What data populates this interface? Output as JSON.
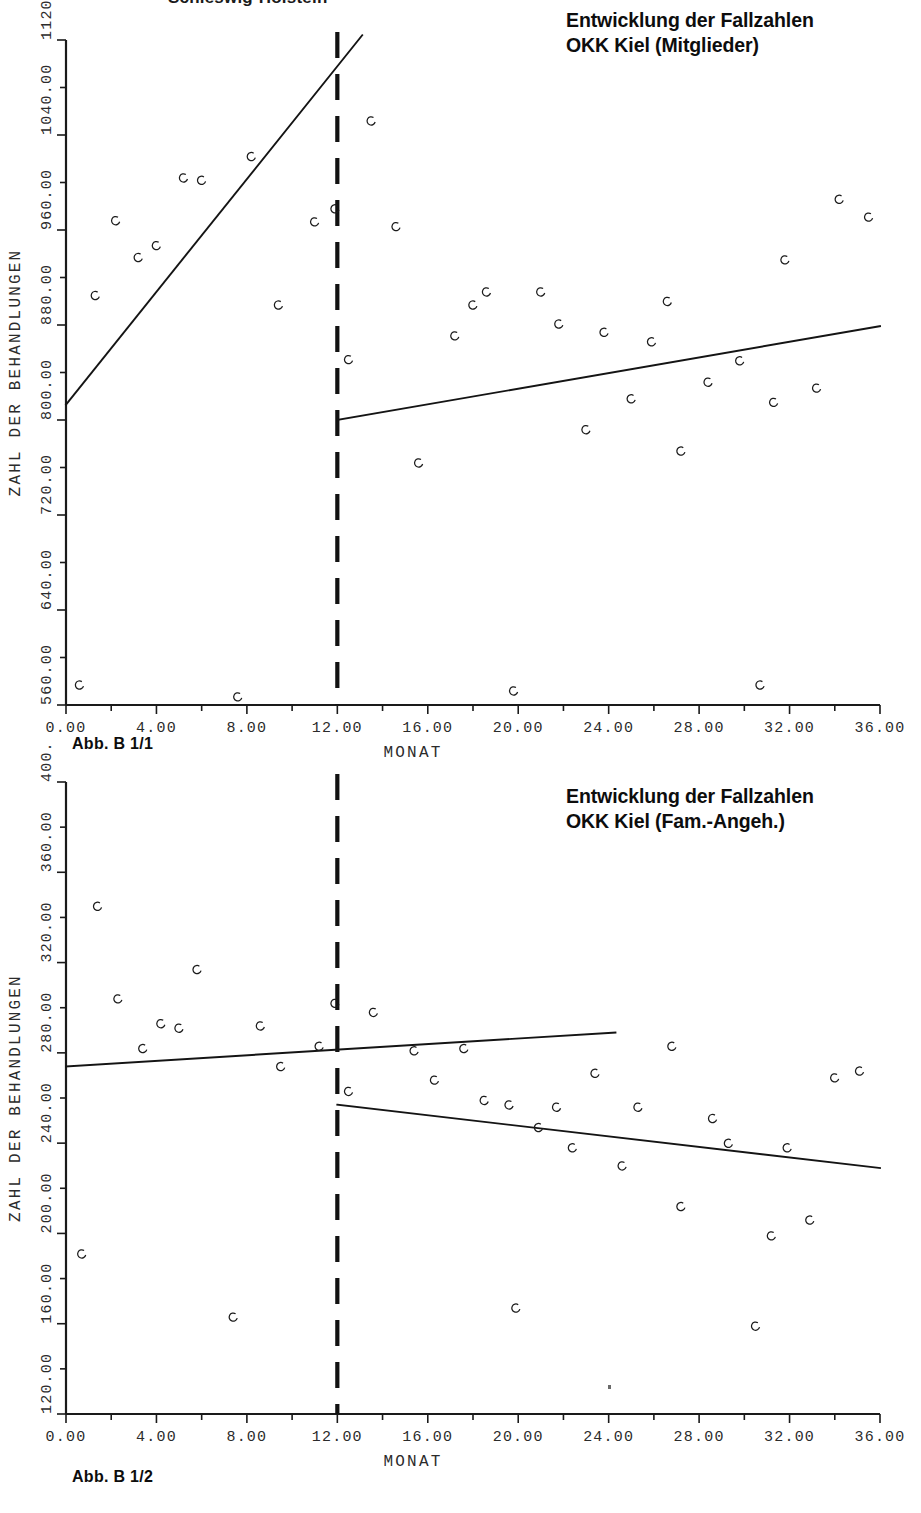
{
  "page": {
    "top_heading": "Schleswig-Holstein"
  },
  "figures": [
    {
      "id": "figure-1",
      "title_lines": [
        "Entwicklung der Fallzahlen",
        "OKK Kiel (Mitglieder)"
      ],
      "caption": "Abb. B 1/1",
      "chart_data": {
        "type": "scatter",
        "title": "Entwicklung der Fallzahlen OKK Kiel (Mitglieder)",
        "xlabel": "MONAT",
        "ylabel": "ZAHL DER BEHANDLUNGEN",
        "xlim": [
          0,
          36
        ],
        "ylim": [
          560,
          1120
        ],
        "xticks": [
          "0.00",
          "4.00",
          "8.00",
          "12.00",
          "16.00",
          "20.00",
          "24.00",
          "28.00",
          "32.00",
          "36.00"
        ],
        "xtick_values": [
          0,
          4,
          8,
          12,
          16,
          20,
          24,
          28,
          32,
          36
        ],
        "yticks": [
          "560.00",
          "640.00",
          "720.00",
          "800.00",
          "880.00",
          "960.00",
          "1040.00",
          "1120.00"
        ],
        "ytick_values": [
          560,
          640,
          720,
          800,
          880,
          960,
          1040,
          1120
        ],
        "grid": false,
        "legend": "none",
        "intervention_marker": {
          "label": "12.00",
          "x": 12,
          "style": "dashed-vertical"
        },
        "points": [
          {
            "x": 0.6,
            "y": 577
          },
          {
            "x": 1.3,
            "y": 905
          },
          {
            "x": 2.2,
            "y": 968
          },
          {
            "x": 3.2,
            "y": 937
          },
          {
            "x": 4.0,
            "y": 947
          },
          {
            "x": 5.2,
            "y": 1004
          },
          {
            "x": 6.0,
            "y": 1002
          },
          {
            "x": 7.6,
            "y": 567
          },
          {
            "x": 8.2,
            "y": 1022
          },
          {
            "x": 9.4,
            "y": 897
          },
          {
            "x": 11.0,
            "y": 967
          },
          {
            "x": 11.9,
            "y": 978
          },
          {
            "x": 12.5,
            "y": 851
          },
          {
            "x": 13.5,
            "y": 1052
          },
          {
            "x": 14.6,
            "y": 963
          },
          {
            "x": 15.6,
            "y": 764
          },
          {
            "x": 17.2,
            "y": 871
          },
          {
            "x": 18.0,
            "y": 897
          },
          {
            "x": 18.6,
            "y": 908
          },
          {
            "x": 19.8,
            "y": 572
          },
          {
            "x": 21.0,
            "y": 908
          },
          {
            "x": 21.8,
            "y": 881
          },
          {
            "x": 23.0,
            "y": 792
          },
          {
            "x": 23.8,
            "y": 874
          },
          {
            "x": 25.0,
            "y": 818
          },
          {
            "x": 25.9,
            "y": 866
          },
          {
            "x": 26.6,
            "y": 900
          },
          {
            "x": 27.2,
            "y": 774
          },
          {
            "x": 28.4,
            "y": 832
          },
          {
            "x": 29.8,
            "y": 850
          },
          {
            "x": 30.7,
            "y": 577
          },
          {
            "x": 31.3,
            "y": 815
          },
          {
            "x": 31.8,
            "y": 935
          },
          {
            "x": 33.2,
            "y": 827
          },
          {
            "x": 34.2,
            "y": 986
          },
          {
            "x": 35.5,
            "y": 971
          }
        ],
        "trend_lines": [
          {
            "name": "pre-intervention",
            "x0": 0,
            "y0": 813,
            "x1": 13.1,
            "y1": 1124
          },
          {
            "name": "post-intervention",
            "x0": 12.0,
            "y0": 800,
            "x1": 36.0,
            "y1": 879
          }
        ]
      }
    },
    {
      "id": "figure-2",
      "title_lines": [
        "Entwicklung der Fallzahlen",
        "OKK Kiel (Fam.-Angeh.)"
      ],
      "caption": "Abb. B 1/2",
      "chart_data": {
        "type": "scatter",
        "title": "Entwicklung der Fallzahlen OKK Kiel (Fam.-Angeh.)",
        "xlabel": "MONAT",
        "ylabel": "ZAHL DER BEHANDLUNGEN",
        "xlim": [
          0,
          36
        ],
        "ylim": [
          120,
          400
        ],
        "xticks": [
          "0.00",
          "4.00",
          "8.00",
          "12.00",
          "16.00",
          "20.00",
          "24.00",
          "28.00",
          "32.00",
          "36.00"
        ],
        "xtick_values": [
          0,
          4,
          8,
          12,
          16,
          20,
          24,
          28,
          32,
          36
        ],
        "yticks": [
          "120.00",
          "160.00",
          "200.00",
          "240.00",
          "280.00",
          "320.00",
          "360.00",
          "400.00"
        ],
        "ytick_values": [
          120,
          160,
          200,
          240,
          280,
          320,
          360,
          400
        ],
        "grid": false,
        "legend": "none",
        "intervention_marker": {
          "label": "12.00",
          "x": 12,
          "style": "dashed-vertical"
        },
        "points": [
          {
            "x": 0.7,
            "y": 191
          },
          {
            "x": 1.4,
            "y": 345
          },
          {
            "x": 2.3,
            "y": 304
          },
          {
            "x": 3.4,
            "y": 282
          },
          {
            "x": 4.2,
            "y": 293
          },
          {
            "x": 5.0,
            "y": 291
          },
          {
            "x": 5.8,
            "y": 317
          },
          {
            "x": 7.4,
            "y": 163
          },
          {
            "x": 8.6,
            "y": 292
          },
          {
            "x": 9.5,
            "y": 274
          },
          {
            "x": 11.2,
            "y": 283
          },
          {
            "x": 11.9,
            "y": 302
          },
          {
            "x": 12.5,
            "y": 263
          },
          {
            "x": 13.6,
            "y": 298
          },
          {
            "x": 15.4,
            "y": 281
          },
          {
            "x": 16.3,
            "y": 268
          },
          {
            "x": 17.6,
            "y": 282
          },
          {
            "x": 18.5,
            "y": 259
          },
          {
            "x": 19.6,
            "y": 257
          },
          {
            "x": 19.9,
            "y": 167
          },
          {
            "x": 20.9,
            "y": 247
          },
          {
            "x": 21.7,
            "y": 256
          },
          {
            "x": 22.4,
            "y": 238
          },
          {
            "x": 23.4,
            "y": 271
          },
          {
            "x": 24.6,
            "y": 230
          },
          {
            "x": 25.3,
            "y": 256
          },
          {
            "x": 26.8,
            "y": 283
          },
          {
            "x": 27.2,
            "y": 212
          },
          {
            "x": 28.6,
            "y": 251
          },
          {
            "x": 29.3,
            "y": 240
          },
          {
            "x": 30.5,
            "y": 159
          },
          {
            "x": 31.2,
            "y": 199
          },
          {
            "x": 31.9,
            "y": 238
          },
          {
            "x": 32.9,
            "y": 206
          },
          {
            "x": 34.0,
            "y": 269
          },
          {
            "x": 35.1,
            "y": 272
          }
        ],
        "trend_lines": [
          {
            "name": "pre-intervention",
            "x0": 0,
            "y0": 274,
            "x1": 24.3,
            "y1": 289
          },
          {
            "name": "post-intervention",
            "x0": 12.0,
            "y0": 257,
            "x1": 36.0,
            "y1": 229
          }
        ]
      }
    }
  ]
}
